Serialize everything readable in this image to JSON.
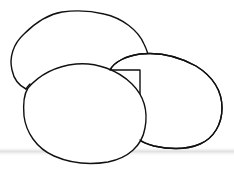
{
  "image": {
    "description": "Line drawing of three overlapping oval shapes (eggs/potatoes) on a white background",
    "background_color": "#ffffff",
    "stroke_color": "#111111",
    "shapes": [
      {
        "name": "back-oval",
        "label": "back oval"
      },
      {
        "name": "right-oval",
        "label": "right oval"
      },
      {
        "name": "front-oval",
        "label": "front oval"
      }
    ]
  }
}
